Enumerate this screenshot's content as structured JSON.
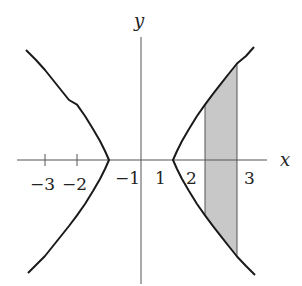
{
  "figure": {
    "equation": "x^2 - y^2 = 1",
    "axes": {
      "x_label": "x",
      "y_label": "y",
      "x_tick_labels": [
        "−3",
        "−2",
        "−1",
        "1",
        "2",
        "3"
      ],
      "x_ticks": [
        -3,
        -2,
        -1,
        1,
        2,
        3
      ]
    },
    "shaded_region": {
      "x_from": 2,
      "x_to": 3,
      "description": "Region between hyperbola branches for 2 ≤ x ≤ 3",
      "fill_color": "#c8c8c8"
    },
    "colors": {
      "curve": "#1a1a1a",
      "axis": "#555555",
      "shade": "#c8c8c8"
    }
  }
}
